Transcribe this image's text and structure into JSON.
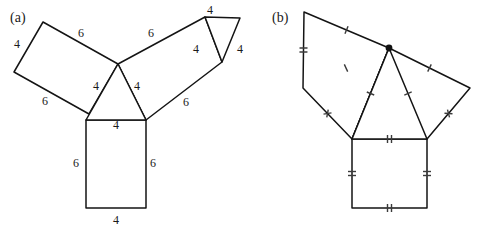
{
  "figure": {
    "panels": [
      {
        "key": "a",
        "caption": "(a)",
        "caption_pos": {
          "x": 10,
          "y": 22
        },
        "description": "central triangle with three attached rectangles and one small triangle, labelled with side lengths",
        "length_labels": [
          {
            "text": "4",
            "x": 17,
            "y": 48
          },
          {
            "text": "6",
            "x": 81,
            "y": 37
          },
          {
            "text": "6",
            "x": 45,
            "y": 105
          },
          {
            "text": "4",
            "x": 96,
            "y": 90
          },
          {
            "text": "4",
            "x": 137,
            "y": 90
          },
          {
            "text": "4",
            "x": 116,
            "y": 129
          },
          {
            "text": "6",
            "x": 151,
            "y": 37
          },
          {
            "text": "6",
            "x": 186,
            "y": 106
          },
          {
            "text": "4",
            "x": 196,
            "y": 53
          },
          {
            "text": "4",
            "x": 210,
            "y": 14
          },
          {
            "text": "4",
            "x": 240,
            "y": 53
          },
          {
            "text": "6",
            "x": 76,
            "y": 167
          },
          {
            "text": "6",
            "x": 153,
            "y": 167
          },
          {
            "text": "4",
            "x": 116,
            "y": 224
          }
        ],
        "shapes": {
          "left_rectangle": "43,22 118,64 89,114 14,72",
          "right_rectangle": "118,64 205,17 222,62 146,120",
          "bottom_rectangle": "86,120 146,120 146,208 86,208",
          "center_triangle": "118,64 146,120 86,120",
          "top_triangle": "205,17 240,18 222,62"
        }
      },
      {
        "key": "b",
        "caption": "(b)",
        "caption_pos": {
          "x": 272,
          "y": 22
        },
        "description": "same configuration marked with congruence tick marks instead of numbers",
        "shapes": {
          "left_quad": "304,12 389,48 352,139 303,88",
          "right_quad": "389,48 470,88 427,139 352,139",
          "square": "352,139 427,139 427,208 352,208",
          "center_triangle": "389,48 427,139 352,139"
        },
        "apex_dot": {
          "x": 389,
          "y": 48,
          "r": 3.4
        },
        "tick_marks": [
          {
            "edge": "left-quad-vertical",
            "count": 2,
            "style": "parallel"
          },
          {
            "edge": "left-quad-top",
            "count": 1,
            "style": "parallel"
          },
          {
            "edge": "left-quad-inner",
            "count": 1,
            "style": "parallel"
          },
          {
            "edge": "left-quad-lower",
            "count": 2,
            "style": "crossed"
          },
          {
            "edge": "right-quad-top",
            "count": 1,
            "style": "parallel"
          },
          {
            "edge": "right-quad-lower",
            "count": 2,
            "style": "crossed"
          },
          {
            "edge": "triangle-left",
            "count": 1,
            "style": "parallel"
          },
          {
            "edge": "triangle-right",
            "count": 1,
            "style": "parallel"
          },
          {
            "edge": "square-top",
            "count": 2,
            "style": "parallel"
          },
          {
            "edge": "square-left",
            "count": 2,
            "style": "parallel"
          },
          {
            "edge": "square-right",
            "count": 2,
            "style": "parallel"
          },
          {
            "edge": "square-bottom",
            "count": 2,
            "style": "parallel"
          }
        ]
      }
    ],
    "colors": {
      "stroke": "#141414",
      "tick": "#3b3b3b",
      "text": "#1a1a1a",
      "background": "#ffffff"
    }
  }
}
